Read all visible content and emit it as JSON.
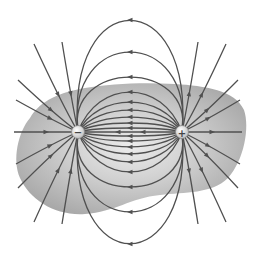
{
  "diagram": {
    "region_label": "shaded region",
    "charges": [
      {
        "name": "negative-charge",
        "sign": "−"
      },
      {
        "name": "positive-charge",
        "sign": "+"
      }
    ],
    "field_direction": "from positive to negative",
    "colors": {
      "line": "#505050",
      "region_edge": "#a8a8a8",
      "region_center": "#e4e4e4",
      "charge_fill": "#f4f4f4"
    }
  }
}
